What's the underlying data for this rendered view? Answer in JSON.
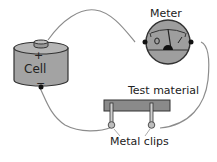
{
  "diagram": {
    "labels": {
      "meter": "Meter",
      "test_material": "Test material",
      "metal_clips": "Metal clips",
      "cell": "Cell",
      "positive": "+",
      "negative": "−"
    },
    "components": [
      {
        "id": "cell",
        "type": "battery-cell",
        "label": "Cell",
        "terminals": [
          "+",
          "−"
        ]
      },
      {
        "id": "meter",
        "type": "analog-meter",
        "label": "Meter"
      },
      {
        "id": "test_material",
        "type": "bar",
        "label": "Test material"
      },
      {
        "id": "clips",
        "type": "metal-clips",
        "label": "Metal clips",
        "count": 2
      }
    ],
    "connections": [
      [
        "cell.+",
        "meter.left"
      ],
      [
        "meter.right",
        "clips.right"
      ],
      [
        "clips.left",
        "cell.−"
      ]
    ],
    "colors": {
      "component_fill": "#9a9a9a",
      "test_bar_fill": "#8a8a8a",
      "outline": "#333333",
      "wire": "#888888",
      "terminal": "#111111"
    }
  }
}
